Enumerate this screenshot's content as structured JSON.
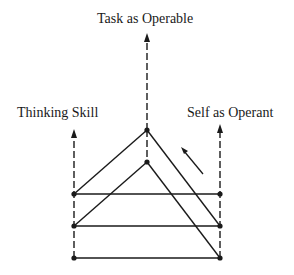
{
  "labels": {
    "task": "Task as Operable",
    "thinking": "Thinking Skill",
    "self": "Self as Operant"
  },
  "colors": {
    "line": "#1a1a1a",
    "background": "#ffffff"
  },
  "diagram": {
    "axes": [
      {
        "name": "Task as Operable",
        "x": 147,
        "arrow_tip_y": 33,
        "style": "dashed"
      },
      {
        "name": "Thinking Skill",
        "x": 74,
        "arrow_tip_y": 129,
        "style": "dashed"
      },
      {
        "name": "Self as Operant",
        "x": 220,
        "arrow_tip_y": 124,
        "style": "dashed"
      }
    ],
    "rows_y": [
      194,
      226,
      258
    ],
    "apexes": [
      {
        "x": 147,
        "y": 130,
        "left_to_row": 1,
        "right_to_row": 2
      },
      {
        "x": 147,
        "y": 162,
        "left_to_row": 2,
        "right_to_row": 3
      }
    ],
    "direction_arrow": {
      "from": [
        203,
        174
      ],
      "to": [
        181,
        148
      ]
    }
  }
}
